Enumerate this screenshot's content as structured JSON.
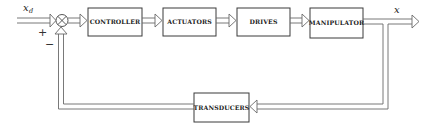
{
  "diagram": {
    "type": "block-diagram",
    "title": "",
    "input_signal": {
      "symbol": "x",
      "subscript": "d"
    },
    "output_signal": {
      "symbol": "x"
    },
    "summing_junction": {
      "plus_sign": "+",
      "minus_sign": "−"
    },
    "blocks": [
      {
        "id": "controller",
        "label": "CONTROLLER"
      },
      {
        "id": "actuators",
        "label": "ACTUATORS"
      },
      {
        "id": "drives",
        "label": "DRIVES"
      },
      {
        "id": "manipulator",
        "label": "MANIPULATOR"
      },
      {
        "id": "transducers",
        "label": "TRANSDUCERS"
      }
    ],
    "connections": [
      {
        "from": "input",
        "to": "summing_junction",
        "sign": "+"
      },
      {
        "from": "summing_junction",
        "to": "controller"
      },
      {
        "from": "controller",
        "to": "actuators"
      },
      {
        "from": "actuators",
        "to": "drives"
      },
      {
        "from": "drives",
        "to": "manipulator"
      },
      {
        "from": "manipulator",
        "to": "output"
      },
      {
        "from": "manipulator",
        "to": "transducers",
        "path": "feedback"
      },
      {
        "from": "transducers",
        "to": "summing_junction",
        "sign": "−"
      }
    ]
  }
}
